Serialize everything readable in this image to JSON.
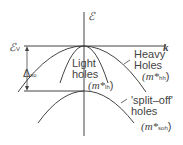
{
  "diagram": {
    "axes": {
      "energy_label": "ℰ",
      "k_label": "k"
    },
    "valence_edge": {
      "label": "ℰ",
      "sub": "V"
    },
    "split_energy": {
      "label": "Δ",
      "sub": "so"
    },
    "heavy_holes": {
      "line1": "Heavy",
      "line2": "Holes",
      "mass": "(m*",
      "mass_sub": "hh",
      "close": ")"
    },
    "light_holes": {
      "line1": "Light",
      "line2": "holes",
      "mass": "(m*",
      "mass_sub": "lh",
      "close": ")"
    },
    "split_off": {
      "line1": "'split–off'",
      "line2": "holes",
      "mass": "(m*",
      "mass_sub": "soh",
      "close": ")"
    },
    "colors": {
      "line": "#444444"
    }
  }
}
